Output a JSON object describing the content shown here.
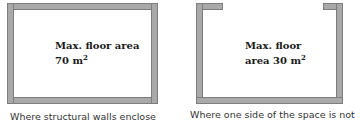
{
  "diagram_left": {
    "label_line1": "Max. floor area",
    "label_line2": "70 m",
    "label_sup": "2",
    "caption": "Where structural walls enclose",
    "enclosure": "fully-enclosed"
  },
  "diagram_right": {
    "label_line1": "Max. floor",
    "label_line2": "area 30 m",
    "label_sup": "2",
    "caption": "Where one side of the space is not",
    "enclosure": "partially-open-top"
  },
  "colors": {
    "wall": "#a9a9a9",
    "wall_edge": "#7d7d7d",
    "text": "#1a1a1a"
  }
}
